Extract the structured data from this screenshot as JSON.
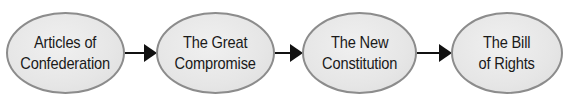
{
  "diagram": {
    "type": "flowchart",
    "direction": "left-to-right",
    "colors": {
      "node_fill": "#e6e6e6",
      "node_border": "#8c8c8c",
      "text": "#1a1a1a",
      "arrow": "#111111"
    },
    "nodes": [
      {
        "id": "articles",
        "line1": "Articles of",
        "line2": "Confederation"
      },
      {
        "id": "great-compromise",
        "line1": "The Great",
        "line2": "Compromise"
      },
      {
        "id": "new-constitution",
        "line1": "The New",
        "line2": "Constitution"
      },
      {
        "id": "bill-of-rights",
        "line1": "The Bill",
        "line2": "of Rights"
      }
    ],
    "edges": [
      {
        "from": "articles",
        "to": "great-compromise"
      },
      {
        "from": "great-compromise",
        "to": "new-constitution"
      },
      {
        "from": "new-constitution",
        "to": "bill-of-rights"
      }
    ]
  }
}
